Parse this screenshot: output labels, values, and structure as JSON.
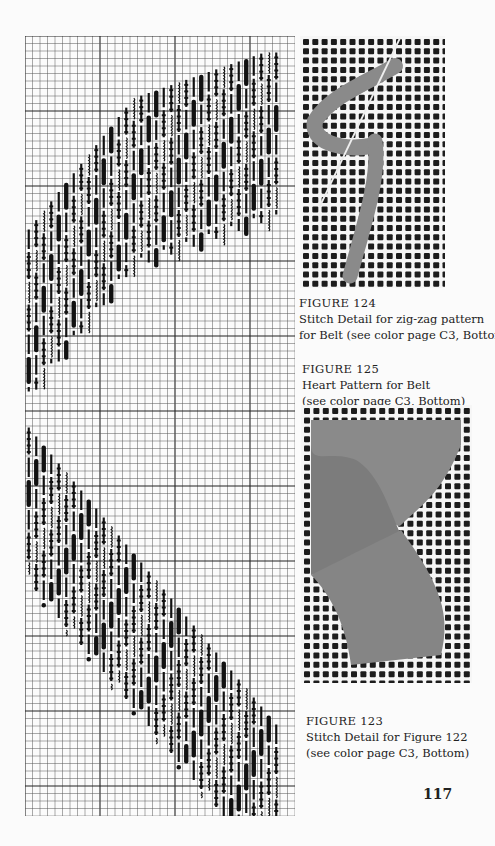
{
  "page": {
    "page_number": "117",
    "colors": {
      "paper": "#fbfbfb",
      "grid_line": "#555555",
      "grid_major": "#222222",
      "stitch": "#111111",
      "canvas_hole": "#1c1c1c",
      "yarn": "#8a8a8a"
    }
  },
  "chart": {
    "grid": {
      "cols": 36,
      "rows": 104,
      "cell_w": 7.5,
      "cell_h": 7.5,
      "major_every": 10
    },
    "bands": [
      {
        "from_col": 0,
        "to_col": 35,
        "start_row": 37,
        "step_rows": -1.15,
        "height_rows": 28,
        "direction": "up"
      },
      {
        "from_col": 0,
        "to_col": 35,
        "start_row": 40,
        "step_rows": 1.25,
        "height_rows": 28,
        "direction": "down"
      }
    ]
  },
  "figures": [
    {
      "id": "fig124",
      "label": "FIGURE  124",
      "lines": [
        "Stitch Detail for zig-zag pattern",
        "for Belt (see color page C3, Bottom)"
      ],
      "photo": "stitch-detail-zigzag"
    },
    {
      "id": "fig125",
      "label": "FIGURE  125",
      "lines": [
        "Heart Pattern for Belt",
        "(see color page C3, Bottom)"
      ],
      "photo": "heart-pattern"
    },
    {
      "id": "fig123",
      "label": "FIGURE  123",
      "lines": [
        "Stitch Detail for Figure 122",
        "(see color page C3, Bottom)"
      ]
    }
  ]
}
